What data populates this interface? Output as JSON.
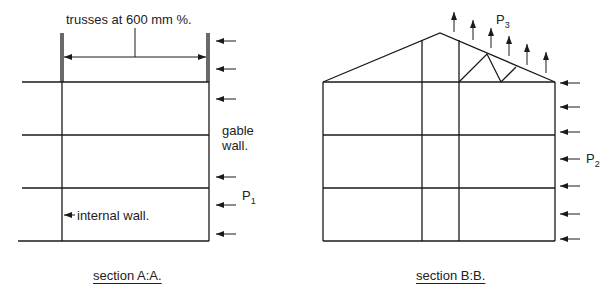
{
  "section_a": {
    "caption": "section A:A.",
    "dimension_label": "trusses at 600 mm %.",
    "gable_wall_line1": "gable",
    "gable_wall_line2": "wall.",
    "internal_wall_label": "internal wall.",
    "load_label": "P",
    "load_subscript": "1"
  },
  "section_b": {
    "caption": "section B:B.",
    "roof_load_label": "P",
    "roof_load_subscript": "3",
    "wall_load_label": "P",
    "wall_load_subscript": "2"
  },
  "colors": {
    "line": "#1a1a1a",
    "background": "#ffffff"
  }
}
